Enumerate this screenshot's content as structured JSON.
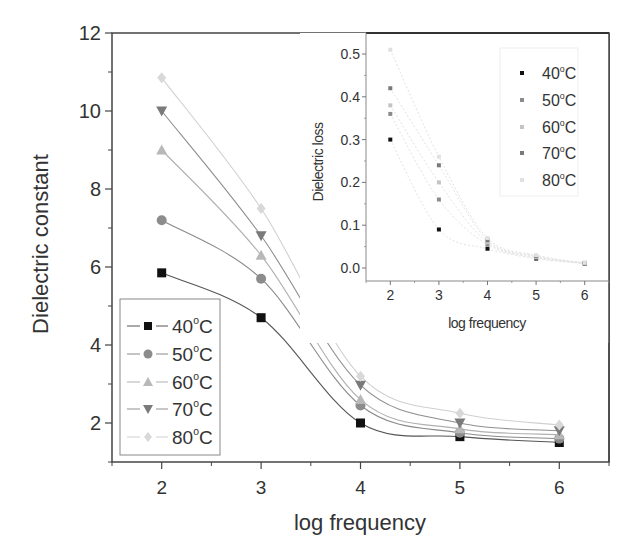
{
  "chart_data": [
    {
      "id": "main",
      "type": "line",
      "title": "",
      "xlabel": "log frequency",
      "ylabel": "Dielectric constant",
      "xlim": [
        1.5,
        6.5
      ],
      "ylim": [
        1,
        12
      ],
      "xticks": [
        2,
        3,
        4,
        5,
        6
      ],
      "yticks": [
        2,
        4,
        6,
        8,
        10,
        12
      ],
      "grid": false,
      "legend_position": "lower-left",
      "x": [
        2,
        3,
        4,
        5,
        6
      ],
      "series": [
        {
          "name": "40°C",
          "label_base": "40",
          "marker": "square",
          "color": "#111111",
          "line_color": "#555555",
          "values": [
            5.85,
            4.7,
            2.0,
            1.65,
            1.5
          ]
        },
        {
          "name": "50°C",
          "label_base": "50",
          "marker": "circle",
          "color": "#8c8c8c",
          "line_color": "#8a8a8a",
          "values": [
            7.2,
            5.7,
            2.45,
            1.75,
            1.6
          ]
        },
        {
          "name": "60°C",
          "label_base": "60",
          "marker": "triangle-up",
          "color": "#b8b8b8",
          "line_color": "#b0b0b0",
          "values": [
            9.0,
            6.3,
            2.6,
            1.85,
            1.7
          ]
        },
        {
          "name": "70°C",
          "label_base": "70",
          "marker": "triangle-down",
          "color": "#7a7a7a",
          "line_color": "#8f8f8f",
          "values": [
            10.0,
            6.8,
            2.97,
            2.0,
            1.8
          ]
        },
        {
          "name": "80°C",
          "label_base": "80",
          "marker": "diamond",
          "color": "#d8d8d8",
          "line_color": "#d0d0d0",
          "values": [
            10.85,
            7.5,
            3.2,
            2.25,
            1.95
          ]
        }
      ]
    },
    {
      "id": "inset",
      "type": "scatter",
      "title": "",
      "xlabel": "log frequency",
      "ylabel": "Dielectric loss",
      "xlim": [
        1.5,
        6.5
      ],
      "ylim": [
        -0.03,
        0.55
      ],
      "xticks": [
        2,
        3,
        4,
        5,
        6
      ],
      "yticks": [
        0.0,
        0.1,
        0.2,
        0.3,
        0.4,
        0.5
      ],
      "ytick_labels": [
        "0.0",
        "0.1",
        "0.2",
        "0.3",
        "0.4",
        "0.5"
      ],
      "grid": false,
      "legend_position": "upper-right",
      "x": [
        2,
        3,
        4,
        5,
        6
      ],
      "series": [
        {
          "name": "40°C",
          "label_base": "40",
          "color": "#111111",
          "values": [
            0.3,
            0.09,
            0.045,
            0.022,
            0.01
          ]
        },
        {
          "name": "50°C",
          "label_base": "50",
          "color": "#8c8c8c",
          "values": [
            0.36,
            0.16,
            0.055,
            0.024,
            0.011
          ]
        },
        {
          "name": "60°C",
          "label_base": "60",
          "color": "#c4c4c4",
          "values": [
            0.38,
            0.2,
            0.06,
            0.026,
            0.011
          ]
        },
        {
          "name": "70°C",
          "label_base": "70",
          "color": "#7a7a7a",
          "values": [
            0.42,
            0.24,
            0.065,
            0.028,
            0.012
          ]
        },
        {
          "name": "80°C",
          "label_base": "80",
          "color": "#e0e0e0",
          "values": [
            0.51,
            0.26,
            0.07,
            0.03,
            0.012
          ]
        }
      ]
    }
  ],
  "labels": {
    "degree_symbol": "o",
    "unit": "C"
  }
}
